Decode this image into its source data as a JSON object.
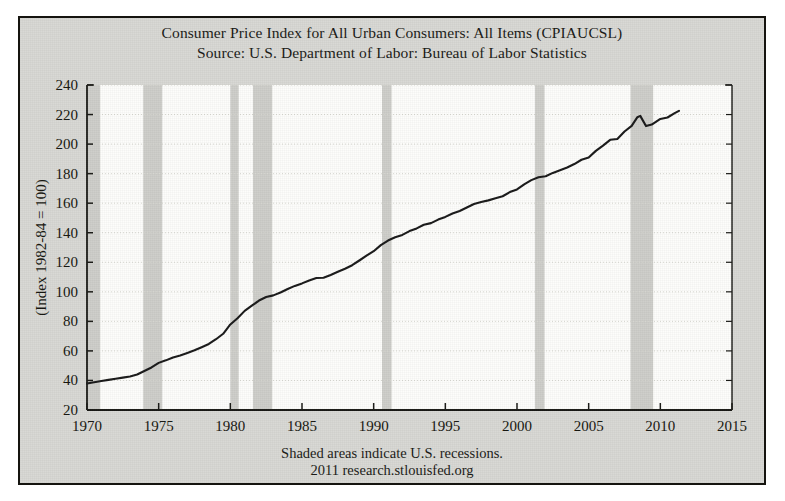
{
  "figure": {
    "title_lines": [
      "Consumer Price Index for All Urban Consumers: All Items (CPIAUCSL)",
      "Source: U.S. Department of Labor: Bureau of Labor Statistics"
    ],
    "footer_lines": [
      "Shaded areas indicate U.S. recessions.",
      "2011 research.stlouisfed.org"
    ],
    "colors": {
      "background": "#d8d8d4",
      "plot_area": "#fdfdfb",
      "border": "#15140f",
      "line": "#1a1a1a",
      "recession_band": "#c9c9c4",
      "gridline": "#d7d7d0",
      "text": "#1a1a16"
    }
  },
  "chart_data": {
    "type": "line",
    "title": "Consumer Price Index for All Urban Consumers: All Items (CPIAUCSL)",
    "subtitle": "Source: U.S. Department of Labor: Bureau of Labor Statistics",
    "xlabel": "",
    "ylabel": "(Index 1982-84 = 100)",
    "xlim": [
      1970,
      2015
    ],
    "ylim": [
      20,
      240
    ],
    "xticks": [
      1970,
      1975,
      1980,
      1985,
      1990,
      1995,
      2000,
      2005,
      2010,
      2015
    ],
    "yticks": [
      20,
      40,
      60,
      80,
      100,
      120,
      140,
      160,
      180,
      200,
      220,
      240
    ],
    "grid": true,
    "legend": "none",
    "annotations": [
      "Shaded areas indicate U.S. recessions.",
      "2011 research.stlouisfed.org"
    ],
    "series": [
      {
        "name": "CPIAUCSL",
        "x": [
          1970.0,
          1970.5,
          1971.0,
          1971.5,
          1972.0,
          1972.5,
          1973.0,
          1973.5,
          1974.0,
          1974.5,
          1975.0,
          1975.5,
          1976.0,
          1976.5,
          1977.0,
          1977.5,
          1978.0,
          1978.5,
          1979.0,
          1979.5,
          1980.0,
          1980.5,
          1981.0,
          1981.5,
          1982.0,
          1982.5,
          1983.0,
          1983.5,
          1984.0,
          1984.5,
          1985.0,
          1985.5,
          1986.0,
          1986.5,
          1987.0,
          1987.5,
          1988.0,
          1988.5,
          1989.0,
          1989.5,
          1990.0,
          1990.5,
          1991.0,
          1991.5,
          1992.0,
          1992.5,
          1993.0,
          1993.5,
          1994.0,
          1994.5,
          1995.0,
          1995.5,
          1996.0,
          1996.5,
          1997.0,
          1997.5,
          1998.0,
          1998.5,
          1999.0,
          1999.5,
          2000.0,
          2000.5,
          2001.0,
          2001.5,
          2002.0,
          2002.5,
          2003.0,
          2003.5,
          2004.0,
          2004.5,
          2005.0,
          2005.5,
          2006.0,
          2006.5,
          2007.0,
          2007.5,
          2008.0,
          2008.4,
          2008.6,
          2009.0,
          2009.4,
          2010.0,
          2010.5,
          2011.0,
          2011.3
        ],
        "y": [
          37.9,
          38.8,
          39.6,
          40.4,
          41.2,
          41.9,
          42.7,
          44.0,
          46.4,
          48.8,
          51.9,
          53.6,
          55.6,
          56.9,
          58.6,
          60.4,
          62.5,
          64.7,
          67.9,
          71.6,
          77.9,
          82.1,
          87.1,
          90.6,
          94.1,
          96.5,
          97.6,
          99.5,
          101.9,
          104.0,
          105.7,
          107.7,
          109.4,
          109.5,
          111.4,
          113.6,
          115.6,
          118.0,
          121.2,
          124.5,
          127.5,
          131.6,
          134.7,
          136.9,
          138.5,
          141.1,
          142.9,
          145.4,
          146.5,
          148.9,
          150.7,
          153.0,
          154.7,
          157.1,
          159.4,
          160.8,
          161.9,
          163.3,
          164.7,
          167.5,
          169.3,
          172.7,
          175.6,
          177.5,
          178.2,
          180.5,
          182.3,
          184.2,
          186.5,
          189.4,
          190.9,
          195.4,
          199.0,
          202.9,
          203.4,
          208.5,
          212.3,
          218.2,
          219.1,
          212.2,
          213.2,
          217.0,
          218.0,
          221.0,
          222.5
        ]
      }
    ],
    "recessions": [
      {
        "start": 1969.92,
        "end": 1970.92
      },
      {
        "start": 1973.92,
        "end": 1975.25
      },
      {
        "start": 1980.0,
        "end": 1980.58
      },
      {
        "start": 1981.58,
        "end": 1982.92
      },
      {
        "start": 1990.58,
        "end": 1991.25
      },
      {
        "start": 2001.25,
        "end": 2001.92
      },
      {
        "start": 2007.92,
        "end": 2009.5
      }
    ]
  }
}
